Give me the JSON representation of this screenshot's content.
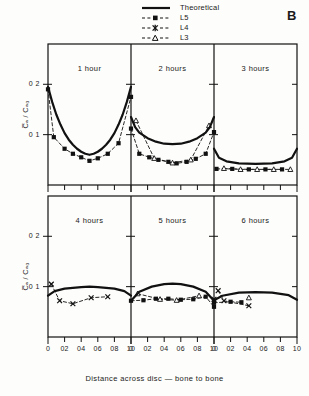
{
  "figure": {
    "panel_letter": "B",
    "x_caption": "Distance across disc — bone to bone",
    "y_axis_label": "C̅ₐ / Cₐ₀"
  },
  "legend": {
    "entries": [
      {
        "label": "Theoretical",
        "style": "solid-line",
        "marker": "none"
      },
      {
        "label": "L5",
        "style": "dashed-line",
        "marker": "filled-square"
      },
      {
        "label": "L4",
        "style": "dashed-line",
        "marker": "cross"
      },
      {
        "label": "L3",
        "style": "dashed-line",
        "marker": "open-triangle"
      }
    ]
  },
  "axes": {
    "x_ticks": [
      "0",
      "02",
      "04",
      "06",
      "08",
      "10"
    ],
    "x_tick_values": [
      0,
      0.2,
      0.4,
      0.6,
      0.8,
      1.0
    ],
    "y_ticks": [
      "0 2",
      "0 1"
    ],
    "y_tick_values": [
      0.2,
      0.1
    ],
    "xlim": [
      0,
      1
    ],
    "ylim": [
      0,
      0.28
    ]
  },
  "chart_data": {
    "type": "line",
    "title": "",
    "xlabel": "Distance across disc — bone to bone",
    "ylabel": "C̅ₐ / Cₐ₀",
    "xlim": [
      0,
      1
    ],
    "ylim": [
      0,
      0.28
    ],
    "grid": false,
    "legend_position": "top-center",
    "panel_letter": "B",
    "panels": [
      {
        "title": "1 hour",
        "row": 0,
        "col": 0,
        "series": [
          {
            "name": "Theoretical",
            "style": "solid",
            "x": [
              0.0,
              0.05,
              0.1,
              0.15,
              0.2,
              0.25,
              0.3,
              0.35,
              0.4,
              0.45,
              0.5,
              0.55,
              0.6,
              0.65,
              0.7,
              0.75,
              0.8,
              0.85,
              0.9,
              0.95,
              1.0
            ],
            "y": [
              0.195,
              0.165,
              0.14,
              0.12,
              0.103,
              0.09,
              0.08,
              0.072,
              0.066,
              0.062,
              0.06,
              0.062,
              0.066,
              0.072,
              0.08,
              0.09,
              0.103,
              0.12,
              0.14,
              0.165,
              0.195
            ]
          },
          {
            "name": "L5",
            "style": "dashed",
            "marker": "filled-square",
            "x": [
              0.0,
              0.07,
              0.2,
              0.3,
              0.4,
              0.5,
              0.6,
              0.72,
              0.85,
              1.0
            ],
            "y": [
              0.19,
              0.095,
              0.072,
              0.062,
              0.055,
              0.048,
              0.053,
              0.062,
              0.083,
              0.175
            ]
          }
        ]
      },
      {
        "title": "2 hours",
        "row": 0,
        "col": 1,
        "series": [
          {
            "name": "Theoretical",
            "style": "solid",
            "x": [
              0.0,
              0.05,
              0.1,
              0.2,
              0.3,
              0.4,
              0.5,
              0.6,
              0.7,
              0.8,
              0.9,
              0.95,
              1.0
            ],
            "y": [
              0.135,
              0.115,
              0.104,
              0.093,
              0.086,
              0.082,
              0.081,
              0.082,
              0.086,
              0.093,
              0.104,
              0.115,
              0.135
            ]
          },
          {
            "name": "L5",
            "style": "dashed",
            "marker": "filled-square",
            "x": [
              0.0,
              0.1,
              0.22,
              0.33,
              0.45,
              0.55,
              0.67,
              0.78,
              0.9,
              1.0
            ],
            "y": [
              0.112,
              0.062,
              0.055,
              0.05,
              0.046,
              0.043,
              0.046,
              0.052,
              0.062,
              0.105
            ]
          },
          {
            "name": "L3",
            "style": "dashed",
            "marker": "open-triangle",
            "x": [
              0.06,
              0.28,
              0.5,
              0.72,
              0.94
            ],
            "y": [
              0.128,
              0.053,
              0.044,
              0.05,
              0.118
            ]
          }
        ]
      },
      {
        "title": "3 hours",
        "row": 0,
        "col": 2,
        "series": [
          {
            "name": "Theoretical",
            "style": "solid",
            "x": [
              0.0,
              0.06,
              0.15,
              0.3,
              0.5,
              0.7,
              0.85,
              0.94,
              1.0
            ],
            "y": [
              0.072,
              0.054,
              0.047,
              0.043,
              0.042,
              0.043,
              0.047,
              0.054,
              0.072
            ]
          },
          {
            "name": "L5",
            "style": "dashed",
            "marker": "filled-square",
            "x": [
              0.03,
              0.22,
              0.42,
              0.62,
              0.82
            ],
            "y": [
              0.032,
              0.032,
              0.031,
              0.031,
              0.031
            ]
          },
          {
            "name": "L3",
            "style": "dashed",
            "marker": "open-triangle",
            "x": [
              0.12,
              0.32,
              0.52,
              0.72,
              0.92
            ],
            "y": [
              0.033,
              0.031,
              0.031,
              0.031,
              0.031
            ]
          }
        ]
      },
      {
        "title": "4 hours",
        "row": 1,
        "col": 0,
        "series": [
          {
            "name": "Theoretical",
            "style": "solid",
            "x": [
              0.0,
              0.08,
              0.2,
              0.4,
              0.5,
              0.6,
              0.8,
              0.92,
              1.0
            ],
            "y": [
              0.082,
              0.091,
              0.096,
              0.099,
              0.1,
              0.099,
              0.096,
              0.091,
              0.082
            ]
          },
          {
            "name": "L4",
            "style": "dashed",
            "marker": "cross",
            "x": [
              0.04,
              0.14,
              0.3,
              0.52,
              0.72
            ],
            "y": [
              0.105,
              0.072,
              0.066,
              0.078,
              0.08
            ]
          }
        ]
      },
      {
        "title": "5 hours",
        "row": 1,
        "col": 1,
        "series": [
          {
            "name": "Theoretical",
            "style": "solid",
            "x": [
              0.0,
              0.1,
              0.25,
              0.4,
              0.5,
              0.6,
              0.75,
              0.9,
              1.0
            ],
            "y": [
              0.072,
              0.09,
              0.1,
              0.105,
              0.106,
              0.105,
              0.1,
              0.09,
              0.072
            ]
          },
          {
            "name": "L5",
            "style": "dashed",
            "marker": "filled-square",
            "x": [
              0.0,
              0.15,
              0.3,
              0.45,
              0.6,
              0.75,
              0.9,
              1.0
            ],
            "y": [
              0.072,
              0.073,
              0.076,
              0.076,
              0.074,
              0.075,
              0.08,
              0.06
            ]
          },
          {
            "name": "L3",
            "style": "dashed",
            "marker": "open-triangle",
            "x": [
              0.08,
              0.35,
              0.55,
              0.82
            ],
            "y": [
              0.086,
              0.075,
              0.073,
              0.082
            ]
          },
          {
            "name": "L4",
            "style": "dashed",
            "marker": "cross",
            "x": [
              1.0
            ],
            "y": [
              0.075
            ]
          }
        ]
      },
      {
        "title": "6 hours",
        "row": 1,
        "col": 2,
        "series": [
          {
            "name": "Theoretical",
            "style": "solid",
            "x": [
              0.0,
              0.1,
              0.3,
              0.5,
              0.7,
              0.9,
              1.0
            ],
            "y": [
              0.073,
              0.082,
              0.088,
              0.089,
              0.088,
              0.083,
              0.074
            ]
          },
          {
            "name": "L5",
            "style": "dashed",
            "marker": "filled-square",
            "x": [
              0.0,
              0.2,
              0.33
            ],
            "y": [
              0.068,
              0.07,
              0.069
            ]
          },
          {
            "name": "L4",
            "style": "dashed",
            "marker": "cross",
            "x": [
              0.05,
              0.12,
              0.42
            ],
            "y": [
              0.092,
              0.072,
              0.062
            ]
          },
          {
            "name": "L3",
            "style": "dashed",
            "marker": "open-triangle",
            "x": [
              0.42
            ],
            "y": [
              0.078
            ]
          }
        ]
      }
    ]
  }
}
